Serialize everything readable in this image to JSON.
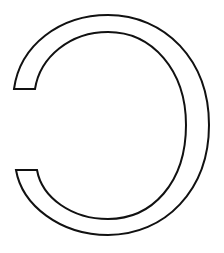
{
  "figure": {
    "description": "Outlined reversed letter C shape (open on the left)",
    "shape": "reversed-c-outline",
    "stroke_color": "#111111",
    "fill_color": "#ffffff",
    "background_color": "#ffffff",
    "stroke_width": 2
  }
}
